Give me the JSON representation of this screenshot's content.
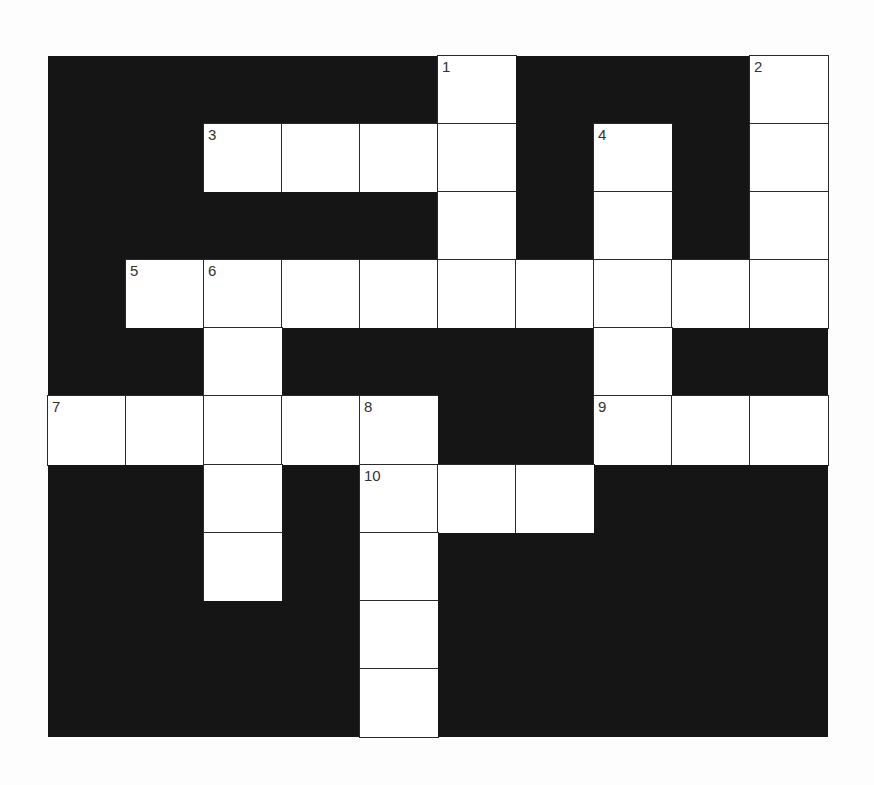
{
  "puzzle": {
    "rows": 10,
    "cols": 10,
    "layout": [
      "#####1###2",
      "##3...#4#.",
      "#####.#.#.",
      "#56.......",
      "##.####.##",
      "7...8##9..",
      "##.#a..###",
      "##.#.#####",
      "####.#####",
      "####.#####"
    ],
    "numbers": [
      {
        "row": 0,
        "col": 5,
        "n": "1"
      },
      {
        "row": 0,
        "col": 9,
        "n": "2"
      },
      {
        "row": 1,
        "col": 2,
        "n": "3"
      },
      {
        "row": 1,
        "col": 7,
        "n": "4"
      },
      {
        "row": 3,
        "col": 1,
        "n": "5"
      },
      {
        "row": 3,
        "col": 2,
        "n": "6"
      },
      {
        "row": 5,
        "col": 0,
        "n": "7"
      },
      {
        "row": 5,
        "col": 4,
        "n": "8"
      },
      {
        "row": 5,
        "col": 7,
        "n": "9"
      },
      {
        "row": 6,
        "col": 4,
        "n": "10"
      }
    ],
    "colors": {
      "block": "#151515",
      "cell": "#ffffff",
      "line": "#2a2a2a"
    }
  }
}
